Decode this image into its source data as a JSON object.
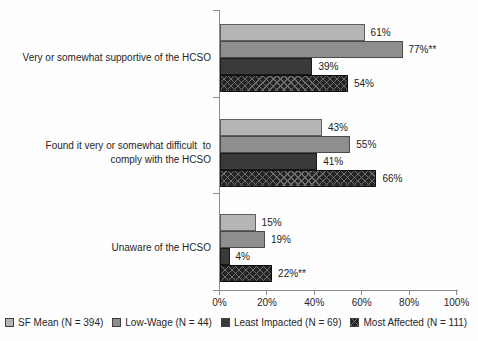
{
  "chart_data": {
    "type": "bar",
    "orientation": "horizontal",
    "title": "",
    "xlabel": "",
    "ylabel": "",
    "xlim": [
      0,
      100
    ],
    "x_ticks": [
      "0%",
      "20%",
      "40%",
      "60%",
      "80%",
      "100%"
    ],
    "grid": false,
    "legend_position": "bottom",
    "series_names": [
      "SF Mean (N = 394)",
      "Low-Wage (N = 44)",
      "Least Impacted (N = 69)",
      "Most Affected (N = 111)"
    ],
    "groups": [
      {
        "category": "Very or somewhat supportive of the HCSO",
        "category_lines": [
          "Very or somewhat supportive of the HCSO"
        ],
        "values": [
          61,
          77,
          39,
          54
        ],
        "labels": [
          "61%",
          "77%**",
          "39%",
          "54%"
        ]
      },
      {
        "category": "Found it very or somewhat difficult  to comply with the HCSO",
        "category_lines": [
          "Found it very or somewhat difficult  to",
          "comply with the HCSO"
        ],
        "values": [
          43,
          55,
          41,
          66
        ],
        "labels": [
          "43%",
          "55%",
          "41%",
          "66%"
        ]
      },
      {
        "category": "Unaware of the HCSO",
        "category_lines": [
          "Unaware of the HCSO"
        ],
        "values": [
          15,
          19,
          4,
          22
        ],
        "labels": [
          "15%",
          "19%",
          "4%",
          "22%**"
        ]
      }
    ],
    "colors": {
      "sf_mean": "#b5b5b5",
      "low_wage": "#8e8e8e",
      "least_impacted": "#3a3a3a",
      "most_affected": "#242424",
      "crosshatch_line": "#6f6f6f",
      "axis": "#8c8c8c",
      "text": "#262626"
    }
  }
}
